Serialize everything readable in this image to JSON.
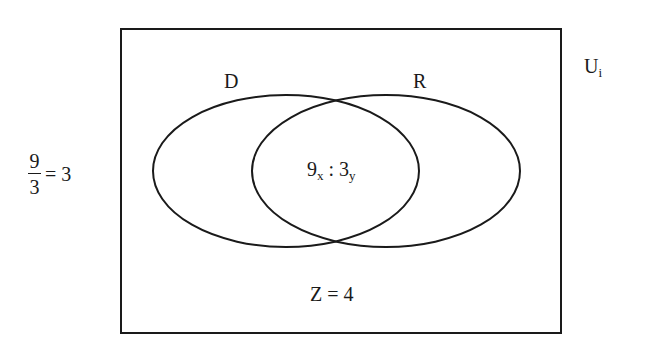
{
  "diagram": {
    "type": "venn",
    "universe": {
      "label_base": "U",
      "label_sub": "i",
      "rect": {
        "x": 121,
        "y": 29,
        "width": 440,
        "height": 304
      }
    },
    "sets": [
      {
        "name": "D",
        "label": "D",
        "ellipse": {
          "cx": 286,
          "cy": 171,
          "rx": 133,
          "ry": 76
        }
      },
      {
        "name": "R",
        "label": "R",
        "ellipse": {
          "cx": 386,
          "cy": 171,
          "rx": 134,
          "ry": 76
        }
      }
    ],
    "intersection": {
      "left_base": "9",
      "left_sub": "x",
      "separator": " : ",
      "right_base": "3",
      "right_sub": "y"
    },
    "outside": {
      "text": "Z = 4"
    },
    "side_equation": {
      "numerator": "9",
      "denominator": "3",
      "result": "= 3"
    },
    "colors": {
      "stroke": "#1a1a1a",
      "background": "#ffffff"
    }
  }
}
